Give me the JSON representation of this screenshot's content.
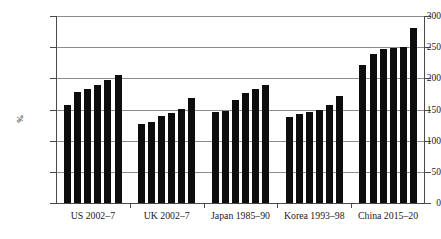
{
  "chart_data": {
    "type": "bar",
    "title": "",
    "xlabel": "",
    "ylabel": "%",
    "ylim": [
      0,
      300
    ],
    "yticks": [
      0,
      50,
      100,
      150,
      200,
      250,
      300
    ],
    "ytick_labels": [
      "0",
      "50",
      "100",
      "150",
      "200",
      "250",
      "300"
    ],
    "grid": true,
    "legend": false,
    "categories": [
      "US 2002–7",
      "UK 2002–7",
      "Japan 1985–90",
      "Korea 1993–98",
      "China 2015–20"
    ],
    "groups": [
      {
        "label": "US 2002–7",
        "values": [
          158,
          178,
          183,
          189,
          197,
          205
        ]
      },
      {
        "label": "UK 2002–7",
        "values": [
          126,
          130,
          140,
          145,
          151,
          169
        ]
      },
      {
        "label": "Japan 1985–90",
        "values": [
          146,
          147,
          165,
          176,
          183,
          190
        ]
      },
      {
        "label": "Korea 1993–98",
        "values": [
          138,
          143,
          146,
          149,
          157,
          172
        ]
      },
      {
        "label": "China 2015–20",
        "values": [
          221,
          239,
          247,
          248,
          250,
          280
        ]
      }
    ],
    "bar_color": "#0d0d0d",
    "grid_color": "#8c8c8c",
    "axis_color": "#4a4a4a"
  }
}
